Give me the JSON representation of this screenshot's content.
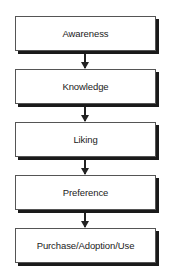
{
  "diagram": {
    "type": "vertical-flowchart",
    "stages": [
      {
        "label": "Awareness"
      },
      {
        "label": "Knowledge"
      },
      {
        "label": "Liking"
      },
      {
        "label": "Preference"
      },
      {
        "label": "Purchase/Adoption/Use"
      }
    ],
    "connectors": [
      {
        "from": "Awareness",
        "to": "Knowledge"
      },
      {
        "from": "Knowledge",
        "to": "Liking"
      },
      {
        "from": "Liking",
        "to": "Preference"
      },
      {
        "from": "Preference",
        "to": "Purchase/Adoption/Use"
      }
    ],
    "colors": {
      "box_fill": "#ffffff",
      "box_border": "#555555",
      "shadow": "#1a1a1a",
      "arrow": "#222222",
      "text": "#222222"
    }
  }
}
